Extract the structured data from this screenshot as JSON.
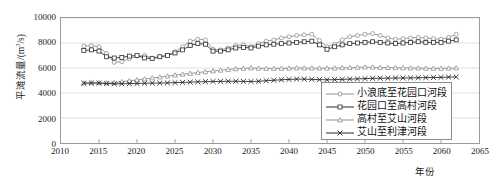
{
  "chart_data": {
    "type": "line",
    "title": "",
    "xlabel": "年份",
    "ylabel": "平滩流量/(m³/s)",
    "ylabel_main": "平滩流量/(m",
    "ylabel_sup": "3",
    "ylabel_tail": "/s)",
    "xlim": [
      2010,
      2065
    ],
    "ylim": [
      0,
      10000
    ],
    "grid": true,
    "legend_position": "bottom-right",
    "xticks": [
      2010,
      2015,
      2020,
      2025,
      2030,
      2035,
      2040,
      2045,
      2050,
      2055,
      2060,
      2065
    ],
    "yticks": [
      0,
      2000,
      4000,
      6000,
      8000,
      10000
    ],
    "x": [
      2013,
      2014,
      2015,
      2016,
      2017,
      2018,
      2019,
      2020,
      2021,
      2022,
      2023,
      2024,
      2025,
      2026,
      2027,
      2028,
      2029,
      2030,
      2031,
      2032,
      2033,
      2034,
      2035,
      2036,
      2037,
      2038,
      2039,
      2040,
      2041,
      2042,
      2043,
      2044,
      2045,
      2046,
      2047,
      2048,
      2049,
      2050,
      2051,
      2052,
      2053,
      2054,
      2055,
      2056,
      2057,
      2058,
      2059,
      2060,
      2061,
      2062
    ],
    "series": [
      {
        "name": "小浪底至花园口河段",
        "marker": "circle",
        "color": "#8f8f8f",
        "values": [
          7750,
          7800,
          7700,
          7150,
          6450,
          6500,
          6750,
          6950,
          7000,
          6800,
          6900,
          7000,
          7300,
          7700,
          8150,
          8300,
          8250,
          7500,
          7450,
          7600,
          7800,
          7850,
          7700,
          7950,
          8150,
          8250,
          8400,
          8500,
          8600,
          8650,
          8700,
          8200,
          7700,
          7900,
          8250,
          8500,
          8600,
          8700,
          8750,
          8600,
          8400,
          8300,
          8350,
          8400,
          8450,
          8400,
          8350,
          8300,
          8450,
          8700
        ]
      },
      {
        "name": "花园口至高村河段",
        "marker": "square",
        "color": "#2b2b2b",
        "values": [
          7400,
          7450,
          7350,
          6900,
          6800,
          6850,
          6950,
          7000,
          6800,
          6750,
          6900,
          7000,
          7200,
          7450,
          7800,
          7950,
          7900,
          7350,
          7350,
          7450,
          7600,
          7650,
          7600,
          7750,
          7850,
          7900,
          7950,
          8000,
          8050,
          8100,
          8150,
          7850,
          7500,
          7700,
          7850,
          7950,
          8000,
          8050,
          8100,
          8050,
          8000,
          7950,
          8000,
          8050,
          8100,
          8050,
          8050,
          8050,
          8150,
          8250
        ]
      },
      {
        "name": "高村至艾山河段",
        "marker": "triangle",
        "color": "#8f8f8f",
        "values": [
          4800,
          4820,
          4820,
          4800,
          4830,
          4900,
          4980,
          5050,
          5120,
          5200,
          5280,
          5350,
          5430,
          5500,
          5570,
          5640,
          5700,
          5760,
          5820,
          5880,
          5930,
          5970,
          6000,
          5980,
          5960,
          5960,
          5970,
          5980,
          6000,
          6000,
          5990,
          5980,
          5980,
          5990,
          6010,
          6030,
          6050,
          6070,
          6060,
          6040,
          6030,
          6020,
          6010,
          6000,
          5990,
          5980,
          5970,
          5970,
          5980,
          6000
        ]
      },
      {
        "name": "艾山至利津河段",
        "marker": "cross",
        "color": "#2b2b2b",
        "values": [
          4780,
          4800,
          4790,
          4760,
          4740,
          4740,
          4750,
          4760,
          4780,
          4790,
          4800,
          4810,
          4830,
          4850,
          4870,
          4890,
          4910,
          4920,
          4930,
          4940,
          4940,
          4930,
          4920,
          4940,
          4980,
          5020,
          5060,
          5090,
          5110,
          5110,
          5090,
          5070,
          5060,
          5070,
          5090,
          5110,
          5130,
          5150,
          5170,
          5180,
          5190,
          5200,
          5200,
          5210,
          5220,
          5230,
          5240,
          5250,
          5270,
          5290
        ]
      }
    ]
  }
}
